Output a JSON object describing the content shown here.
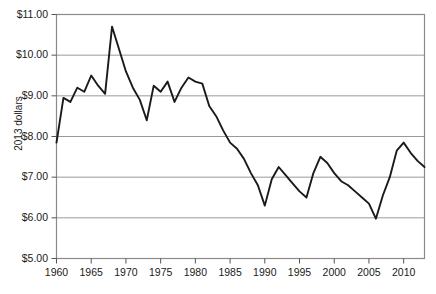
{
  "chart_data": {
    "type": "line",
    "title": "",
    "xlabel": "",
    "ylabel": "2013 dollars",
    "xlim": [
      1960,
      2013
    ],
    "ylim": [
      5.0,
      11.0
    ],
    "grid": true,
    "legend": "none",
    "y_tick_labels": [
      "$11.00",
      "$10.00",
      "$9.00",
      "$8.00",
      "$7.00",
      "$6.00",
      "$5.00"
    ],
    "y_tick_values": [
      11.0,
      10.0,
      9.0,
      8.0,
      7.0,
      6.0,
      5.0
    ],
    "x_tick_labels": [
      "1960",
      "1965",
      "1970",
      "1975",
      "1980",
      "1985",
      "1990",
      "1995",
      "2000",
      "2005",
      "2010"
    ],
    "x_tick_values": [
      1960,
      1965,
      1970,
      1975,
      1980,
      1985,
      1990,
      1995,
      2000,
      2005,
      2010
    ],
    "series": [
      {
        "name": "Real minimum wage",
        "color": "#1a1a1a",
        "x": [
          1960,
          1961,
          1962,
          1963,
          1964,
          1965,
          1966,
          1967,
          1968,
          1969,
          1970,
          1971,
          1972,
          1973,
          1974,
          1975,
          1976,
          1977,
          1978,
          1979,
          1980,
          1981,
          1982,
          1983,
          1984,
          1985,
          1986,
          1987,
          1988,
          1989,
          1990,
          1991,
          1992,
          1993,
          1994,
          1995,
          1996,
          1997,
          1998,
          1999,
          2000,
          2001,
          2002,
          2003,
          2004,
          2005,
          2006,
          2007,
          2008,
          2009,
          2010,
          2011,
          2012,
          2013
        ],
        "y": [
          7.85,
          8.95,
          8.85,
          9.2,
          9.1,
          9.5,
          9.25,
          9.05,
          10.7,
          10.15,
          9.6,
          9.2,
          8.9,
          8.4,
          9.25,
          9.1,
          9.35,
          8.85,
          9.2,
          9.45,
          9.35,
          9.3,
          8.75,
          8.5,
          8.15,
          7.85,
          7.7,
          7.45,
          7.1,
          6.8,
          6.3,
          6.95,
          7.25,
          7.05,
          6.85,
          6.65,
          6.5,
          7.1,
          7.5,
          7.35,
          7.1,
          6.9,
          6.8,
          6.65,
          6.5,
          6.35,
          5.98,
          6.55,
          7.0,
          7.65,
          7.85,
          7.6,
          7.4,
          7.25
        ],
        "peak": {
          "year": 1968,
          "value": 10.7
        },
        "trough": {
          "year": 2006,
          "value": 5.98
        },
        "start": {
          "year": 1960,
          "value": 7.85
        },
        "end": {
          "year": 2013,
          "value": 7.25
        }
      }
    ]
  }
}
